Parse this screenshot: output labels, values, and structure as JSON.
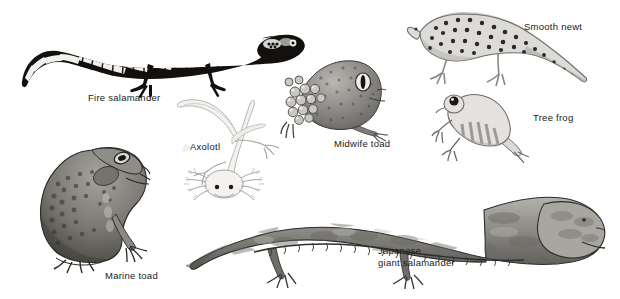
{
  "plate": {
    "title": "Amphibians illustration plate",
    "background_color": "#ffffff",
    "width": 620,
    "height": 299,
    "style": "black-and-white scientific engraving / halftone illustrations"
  },
  "labels": {
    "fire_salamander": "Fire salamander",
    "smooth_newt": "Smooth newt",
    "midwife_toad": "Midwife toad",
    "tree_frog": "Tree frog",
    "axolotl": "Axolotl",
    "marine_toad": "Marine toad",
    "japanese_giant_salamander_line1": "Japanese",
    "japanese_giant_salamander_line2": "giant salamander"
  },
  "specimens": [
    {
      "name": "fire-salamander",
      "label": "Fire salamander",
      "description": "Black salamander with bold white/yellow bands along body and long curving tail, side view facing right",
      "tone": "high-contrast black and white",
      "position": {
        "x": 20,
        "y": 10,
        "w": 290,
        "h": 85
      }
    },
    {
      "name": "smooth-newt",
      "label": "Smooth newt",
      "description": "Spotted newt with crest and flattened tail, side view facing left",
      "tone": "light grey with dark spots",
      "position": {
        "x": 408,
        "y": 8,
        "w": 180,
        "h": 80
      }
    },
    {
      "name": "midwife-toad",
      "label": "Midwife toad",
      "description": "Toad carrying a cluster of eggs on its hind legs and back, three-quarter view facing right",
      "tone": "mid grey stippled",
      "position": {
        "x": 283,
        "y": 58,
        "w": 105,
        "h": 82
      }
    },
    {
      "name": "tree-frog",
      "label": "Tree frog",
      "description": "Small frog with large eye and banded flank, sitting, facing left",
      "tone": "pale grey",
      "position": {
        "x": 434,
        "y": 92,
        "w": 95,
        "h": 70
      }
    },
    {
      "name": "axolotl",
      "label": "Axolotl",
      "description": "Pale axolotl seen from above with feathery external gills and curving tail sweeping to upper left",
      "tone": "very pale grey outline",
      "position": {
        "x": 178,
        "y": 98,
        "w": 118,
        "h": 110
      }
    },
    {
      "name": "marine-toad",
      "label": "Marine toad",
      "description": "Large warty cane toad sitting upright in profile facing right",
      "tone": "dark grey stippled",
      "position": {
        "x": 32,
        "y": 142,
        "w": 128,
        "h": 132
      }
    },
    {
      "name": "japanese-giant-salamander",
      "label": "Japanese giant salamander",
      "description": "Very large mottled salamander with broad flat head, wrinkled skin folds and thick tail, side view facing right",
      "tone": "mottled mid grey",
      "position": {
        "x": 186,
        "y": 192,
        "w": 420,
        "h": 96
      }
    }
  ],
  "label_positions": {
    "fire_salamander": {
      "x": 88,
      "y": 92
    },
    "smooth_newt": {
      "x": 524,
      "y": 21
    },
    "midwife_toad": {
      "x": 334,
      "y": 138
    },
    "tree_frog": {
      "x": 533,
      "y": 112
    },
    "axolotl": {
      "x": 190,
      "y": 141
    },
    "marine_toad": {
      "x": 105,
      "y": 270
    },
    "japanese_giant_salamander": {
      "x": 378,
      "y": 245
    }
  },
  "colors": {
    "background": "#ffffff",
    "text": "#1a1a1a",
    "ink_dark": "#14120f",
    "ink_mid": "#6f6d69",
    "ink_light": "#b9b7b2",
    "ink_pale": "#dedcd8"
  }
}
